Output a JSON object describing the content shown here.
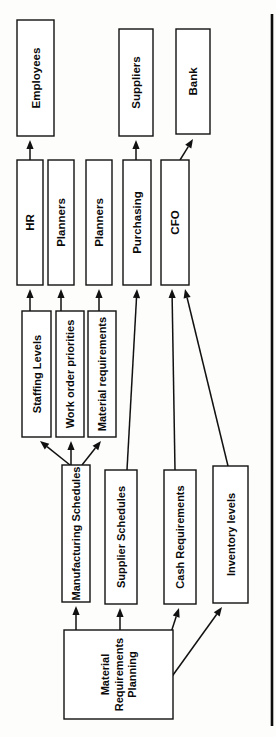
{
  "diagram": {
    "orientation": "rotated-90-counterclockwise",
    "page_rule": {
      "x": 272,
      "y1": 14,
      "y2": 726
    },
    "colors": {
      "box_fill": "#ffffff",
      "box_stroke": "#111111",
      "label_text": "#0a0a0a",
      "edge": "#111111",
      "page_background": "#fdfdfc",
      "page_rule": "#0c0c0c"
    },
    "nodes": [
      {
        "id": "employees",
        "label": "Employees",
        "x": 17,
        "y": 20,
        "w": 37,
        "h": 116,
        "font": 11.5,
        "column": 1
      },
      {
        "id": "suppliers",
        "label": "Suppliers",
        "x": 119,
        "y": 29,
        "w": 34,
        "h": 107,
        "font": 11.5,
        "column": 1
      },
      {
        "id": "bank",
        "label": "Bank",
        "x": 176,
        "y": 29,
        "w": 34,
        "h": 105,
        "font": 11.5,
        "column": 1
      },
      {
        "id": "hr",
        "label": "HR",
        "x": 17,
        "y": 160,
        "w": 26,
        "h": 125,
        "font": 11.5,
        "column": 2
      },
      {
        "id": "planners1",
        "label": "Planners",
        "x": 48,
        "y": 160,
        "w": 26,
        "h": 125,
        "font": 11.5,
        "column": 2
      },
      {
        "id": "planners2",
        "label": "Planners",
        "x": 86,
        "y": 160,
        "w": 26,
        "h": 125,
        "font": 11.5,
        "column": 2
      },
      {
        "id": "purchasing",
        "label": "Purchasing",
        "x": 123,
        "y": 160,
        "w": 28,
        "h": 125,
        "font": 11.5,
        "column": 2
      },
      {
        "id": "cfo",
        "label": "CFO",
        "x": 161,
        "y": 160,
        "w": 28,
        "h": 125,
        "font": 11.5,
        "column": 2
      },
      {
        "id": "staffing",
        "label": "Staffing Levels",
        "x": 22,
        "y": 311,
        "w": 29,
        "h": 126,
        "font": 11,
        "column": 3
      },
      {
        "id": "workorder",
        "label": "Work order priorities",
        "x": 56,
        "y": 311,
        "w": 28,
        "h": 126,
        "font": 11,
        "column": 3
      },
      {
        "id": "materialreq",
        "label": "Material requirements",
        "x": 88,
        "y": 311,
        "w": 28,
        "h": 126,
        "font": 11,
        "column": 3
      },
      {
        "id": "mfgsched",
        "label": "Manufacturing Schedules",
        "x": 62,
        "y": 465,
        "w": 28,
        "h": 137,
        "font": 11,
        "column": 4
      },
      {
        "id": "suppsched",
        "label": "Supplier Schedules",
        "x": 105,
        "y": 470,
        "w": 32,
        "h": 134,
        "font": 11,
        "column": 4
      },
      {
        "id": "cashreq",
        "label": "Cash Requirements",
        "x": 164,
        "y": 470,
        "w": 32,
        "h": 134,
        "font": 11,
        "column": 4
      },
      {
        "id": "invlevels",
        "label": "Inventory levels",
        "x": 213,
        "y": 466,
        "w": 35,
        "h": 137,
        "font": 11,
        "column": 4
      },
      {
        "id": "mrp",
        "label": "Material Requirements Planning",
        "x": 64,
        "y": 630,
        "w": 109,
        "h": 89,
        "font": 11,
        "column": 5
      }
    ],
    "edges": [
      {
        "id": "hr-to-employees",
        "from": "hr",
        "to": "employees",
        "x1": 30,
        "y1": 160,
        "x2": 30,
        "y2": 140
      },
      {
        "id": "purchasing-to-suppliers",
        "from": "purchasing",
        "to": "suppliers",
        "x1": 136,
        "y1": 160,
        "x2": 136,
        "y2": 140
      },
      {
        "id": "cfo-to-bank",
        "from": "cfo",
        "to": "bank",
        "x1": 180,
        "y1": 160,
        "x2": 193,
        "y2": 139
      },
      {
        "id": "staffing-to-hr",
        "from": "staffing",
        "to": "hr",
        "x1": 30,
        "y1": 311,
        "x2": 30,
        "y2": 289
      },
      {
        "id": "workorder-to-planners1",
        "from": "workorder",
        "to": "planners1",
        "x1": 61,
        "y1": 311,
        "x2": 61,
        "y2": 289
      },
      {
        "id": "materialreq-to-planners2",
        "from": "materialreq",
        "to": "planners2",
        "x1": 99,
        "y1": 311,
        "x2": 99,
        "y2": 289
      },
      {
        "id": "suppsched-to-purchasing",
        "from": "suppsched",
        "to": "purchasing",
        "x1": 127,
        "y1": 470,
        "x2": 137,
        "y2": 289
      },
      {
        "id": "cashreq-to-cfo",
        "from": "cashreq",
        "to": "cfo",
        "x1": 175,
        "y1": 470,
        "x2": 172,
        "y2": 289
      },
      {
        "id": "invlevels-to-cfo",
        "from": "invlevels",
        "to": "cfo",
        "x1": 228,
        "y1": 466,
        "x2": 185,
        "y2": 289
      },
      {
        "id": "mfgsched-to-staffing",
        "from": "mfgsched",
        "to": "staffing",
        "x1": 70,
        "y1": 465,
        "x2": 40,
        "y2": 441
      },
      {
        "id": "mfgsched-to-workorder",
        "from": "mfgsched",
        "to": "workorder",
        "x1": 71,
        "y1": 465,
        "x2": 71,
        "y2": 441
      },
      {
        "id": "mfgsched-to-materialreq",
        "from": "mfgsched",
        "to": "materialreq",
        "x1": 82,
        "y1": 465,
        "x2": 101,
        "y2": 441
      },
      {
        "id": "mrp-to-mfgsched",
        "from": "mrp",
        "to": "mfgsched",
        "x1": 76,
        "y1": 630,
        "x2": 76,
        "y2": 606
      },
      {
        "id": "mrp-to-suppsched",
        "from": "mrp",
        "to": "suppsched",
        "x1": 120,
        "y1": 630,
        "x2": 120,
        "y2": 608
      },
      {
        "id": "mrp-to-cashreq",
        "from": "mrp",
        "to": "cashreq",
        "x1": 166,
        "y1": 648,
        "x2": 179,
        "y2": 608
      },
      {
        "id": "mrp-to-invlevels",
        "from": "mrp",
        "to": "invlevels",
        "x1": 168,
        "y1": 682,
        "x2": 222,
        "y2": 607
      }
    ]
  }
}
